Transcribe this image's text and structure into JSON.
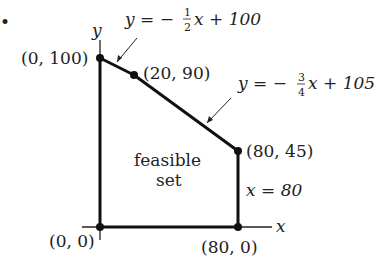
{
  "diagram": {
    "bullet": "•",
    "axes": {
      "x_label": "x",
      "y_label": "y"
    },
    "vertices": [
      {
        "label": "(0, 100)",
        "x": 0,
        "y": 100
      },
      {
        "label": "(20, 90)",
        "x": 20,
        "y": 90
      },
      {
        "label": "(80, 45)",
        "x": 80,
        "y": 45
      },
      {
        "label": "(80, 0)",
        "x": 80,
        "y": 0
      },
      {
        "label": "(0, 0)",
        "x": 0,
        "y": 0
      }
    ],
    "constraints": [
      {
        "lhs": "y = −",
        "num": "1",
        "den": "2",
        "rhs": "x + 100"
      },
      {
        "lhs": "y = −",
        "num": "3",
        "den": "4",
        "rhs": "x + 105"
      },
      {
        "label": "x = 80"
      }
    ],
    "region_label_line1": "feasible",
    "region_label_line2": "set",
    "colors": {
      "line": "#111111",
      "text": "#222222",
      "background": "#ffffff"
    }
  }
}
